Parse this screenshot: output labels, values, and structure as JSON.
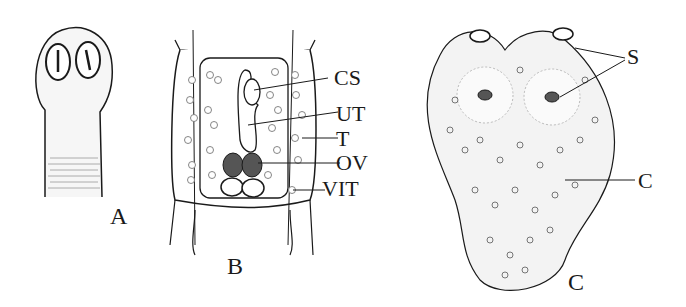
{
  "figure": {
    "panels": [
      {
        "id": "A",
        "label": "A",
        "subject": "scolex with suckers and neck"
      },
      {
        "id": "B",
        "label": "B",
        "subject": "mature proglottid",
        "annotations": [
          "CS",
          "UT",
          "T",
          "OV",
          "VIT"
        ]
      },
      {
        "id": "C",
        "label": "C",
        "subject": "larval stage with suckers",
        "annotations": [
          "S",
          "C"
        ]
      }
    ]
  },
  "panelA": {
    "label": "A"
  },
  "panelB": {
    "label": "B",
    "cs": "CS",
    "ut": "UT",
    "t": "T",
    "ov": "OV",
    "vit": "VIT"
  },
  "panelC": {
    "label": "C",
    "s": "S",
    "c": "C"
  },
  "colors": {
    "ink": "#1a1a1a",
    "paper": "#ffffff",
    "stipple": "#f3f3f3"
  }
}
